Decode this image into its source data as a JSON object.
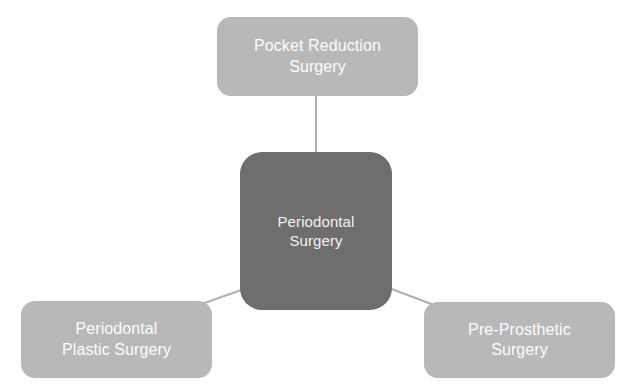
{
  "diagram": {
    "type": "hub-and-spoke",
    "title": "Periodontal Surgery",
    "background_color": "#ffffff",
    "root": {
      "id": "periodontal-surgery",
      "label": "Periodontal\nSurgery",
      "line1": "Periodontal",
      "line2": "Surgery",
      "fill_color": "#6e6e6e",
      "text_color": "#f2f2f2"
    },
    "branches": [
      {
        "id": "pocket-reduction-surgery",
        "label": "Pocket Reduction\nSurgery",
        "line1": "Pocket Reduction",
        "line2": "Surgery",
        "position": "top",
        "fill_color": "#b8b8b8",
        "text_color": "#fdfdfd"
      },
      {
        "id": "periodontal-plastic-surgery",
        "label": "Periodontal\nPlastic Surgery",
        "line1": "Periodontal",
        "line2": "Plastic Surgery",
        "position": "bottom-left",
        "fill_color": "#b8b8b8",
        "text_color": "#fdfdfd"
      },
      {
        "id": "pre-prosthetic-surgery",
        "label": "Pre-Prosthetic\nSurgery",
        "line1": "Pre-Prosthetic",
        "line2": "Surgery",
        "position": "bottom-right",
        "fill_color": "#b8b8b8",
        "text_color": "#fdfdfd"
      }
    ],
    "connectors": [
      {
        "id": "connector-root-to-pocket-reduction",
        "from": "periodontal-surgery",
        "to": "pocket-reduction-surgery",
        "color": "#b0b0b0"
      },
      {
        "id": "connector-root-to-periodontal-plastic",
        "from": "periodontal-surgery",
        "to": "periodontal-plastic-surgery",
        "color": "#b0b0b0"
      },
      {
        "id": "connector-root-to-pre-prosthetic",
        "from": "periodontal-surgery",
        "to": "pre-prosthetic-surgery",
        "color": "#b0b0b0"
      }
    ]
  }
}
